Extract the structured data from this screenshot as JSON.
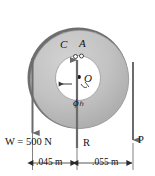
{
  "figure": {
    "colors": {
      "background": "#ffffff",
      "outer_ring_fill": "#b8b8b8",
      "outer_ring_shadow": "#6e6e6e",
      "inner_hub_fill": "#ffffff",
      "outline": "#555555",
      "arrow": "#6b6b6b",
      "text": "#111111"
    },
    "labels": {
      "point_c": "C",
      "point_a": "A",
      "center_o": "O",
      "angle_phi": "ϕₕ",
      "force_w": "W = 500 N",
      "force_r": "R",
      "force_p": "P",
      "dim_left": ".045 m",
      "dim_right": ".055 m"
    },
    "forces": [
      {
        "name": "W",
        "label": "W = 500 N",
        "magnitude": "500 N",
        "direction": "down",
        "position": "left edge"
      },
      {
        "name": "R",
        "label": "R",
        "direction": "up",
        "position": "center vertical axis"
      },
      {
        "name": "P",
        "label": "P",
        "direction": "down",
        "position": "right edge"
      }
    ],
    "dimensions": [
      {
        "label": ".045 m",
        "value": 0.045,
        "unit": "m",
        "span": "left edge to center axis"
      },
      {
        "label": ".055 m",
        "value": 0.055,
        "unit": "m",
        "span": "center axis to right edge"
      }
    ]
  }
}
